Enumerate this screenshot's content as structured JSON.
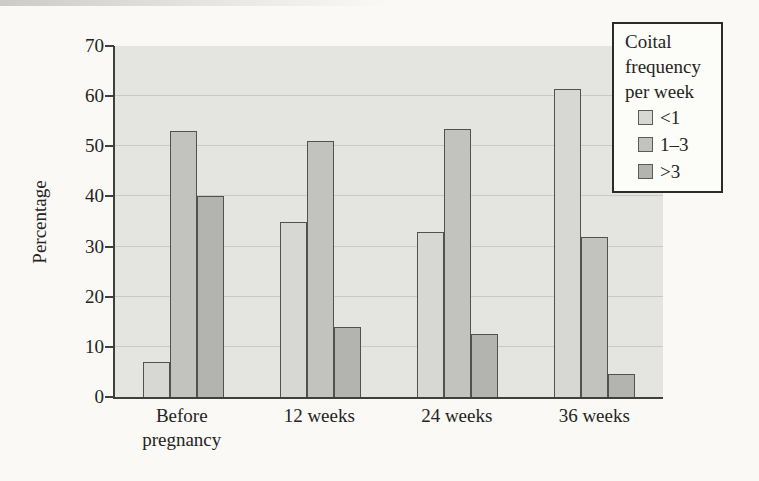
{
  "figure": {
    "page_bg": "#faf9f6",
    "plot_bg": "#e4e4e1",
    "grid_color": "#c9c9c5",
    "axis_color": "#3f3f3d",
    "text_color": "#242422"
  },
  "chart_data": {
    "type": "bar",
    "title": "",
    "xlabel": "",
    "ylabel": "Percentage",
    "ylim": [
      0,
      70
    ],
    "yticks": [
      0,
      10,
      20,
      30,
      40,
      50,
      60,
      70
    ],
    "grid": "horizontal",
    "legend_position": "top-right",
    "legend_title": "Coital frequency per week",
    "categories": [
      "Before pregnancy",
      "12 weeks",
      "24 weeks",
      "36 weeks"
    ],
    "series": [
      {
        "name": "<1",
        "color": "#d7d7d3",
        "values": [
          7,
          35,
          33,
          61.5
        ]
      },
      {
        "name": "1–3",
        "color": "#c2c2bf",
        "values": [
          53,
          51,
          53.5,
          32
        ]
      },
      {
        "name": ">3",
        "color": "#b3b3b0",
        "values": [
          40,
          14,
          12.5,
          4.5
        ]
      }
    ]
  },
  "legend": {
    "title_lines": [
      "Coital",
      "frequency",
      "per week"
    ]
  }
}
